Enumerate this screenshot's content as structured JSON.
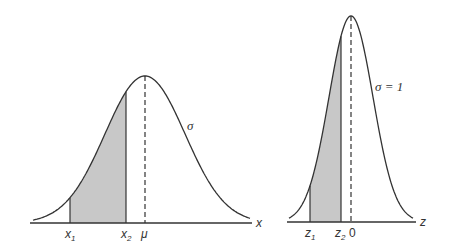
{
  "figure": {
    "left_panel": {
      "title": "General normal distribution",
      "axis_label": "x",
      "mean_label": "μ",
      "sigma_label": "σ",
      "bounds": [
        {
          "base": "x",
          "sub": "1"
        },
        {
          "base": "x",
          "sub": "2"
        }
      ],
      "shaded_region": "between x1 and x2"
    },
    "right_panel": {
      "title": "Standard normal distribution",
      "axis_label": "z",
      "mean_label": "0",
      "sigma_label": "σ = 1",
      "bounds": [
        {
          "base": "z",
          "sub": "1"
        },
        {
          "base": "z",
          "sub": "2"
        }
      ],
      "shaded_region": "between z1 and z2"
    },
    "colors": {
      "line": "#333333",
      "shade": "#c8c8c8",
      "background": "#ffffff"
    }
  }
}
